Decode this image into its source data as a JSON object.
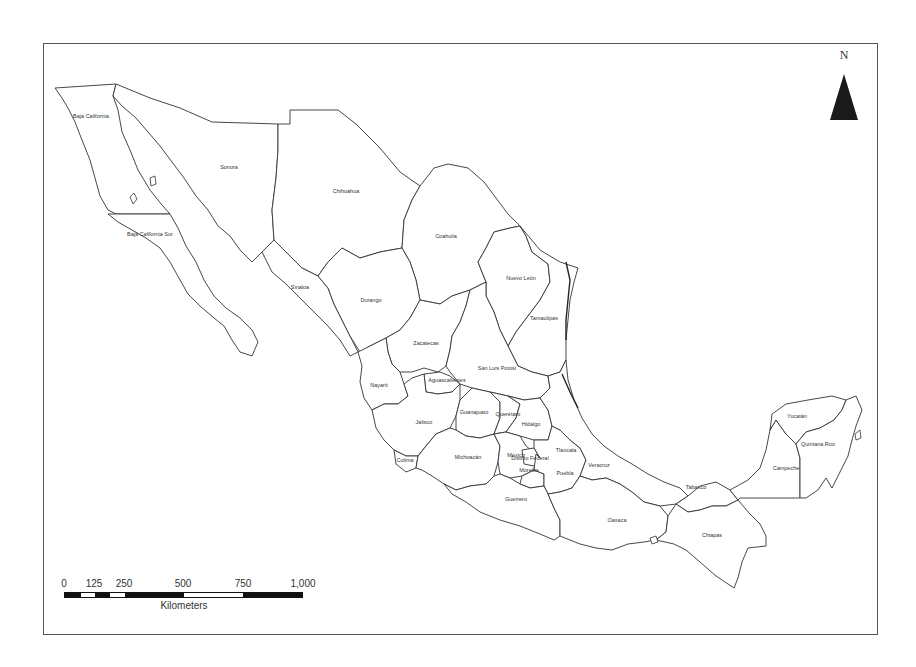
{
  "map": {
    "title": "",
    "country": "Mexico",
    "states": [
      {
        "name": "Baja California",
        "x": 91,
        "y": 118
      },
      {
        "name": "Baja California Sur",
        "x": 150,
        "y": 236
      },
      {
        "name": "Sonora",
        "x": 229,
        "y": 169
      },
      {
        "name": "Chihuahua",
        "x": 346,
        "y": 193
      },
      {
        "name": "Coahuila",
        "x": 446,
        "y": 238
      },
      {
        "name": "Nuevo León",
        "x": 521,
        "y": 280
      },
      {
        "name": "Tamaulipas",
        "x": 544,
        "y": 320
      },
      {
        "name": "Sinaloa",
        "x": 300,
        "y": 289
      },
      {
        "name": "Durango",
        "x": 371,
        "y": 302
      },
      {
        "name": "Zacatecas",
        "x": 426,
        "y": 345
      },
      {
        "name": "San Luis Potosí",
        "x": 497,
        "y": 370
      },
      {
        "name": "Nayarit",
        "x": 379,
        "y": 387
      },
      {
        "name": "Aguascalientes",
        "x": 447,
        "y": 382
      },
      {
        "name": "Guanajuato",
        "x": 474,
        "y": 414
      },
      {
        "name": "Querétaro",
        "x": 508,
        "y": 416
      },
      {
        "name": "Hidalgo",
        "x": 531,
        "y": 426
      },
      {
        "name": "Jalisco",
        "x": 424,
        "y": 424
      },
      {
        "name": "Colima",
        "x": 405,
        "y": 462
      },
      {
        "name": "Michoacán",
        "x": 468,
        "y": 459
      },
      {
        "name": "México",
        "x": 516,
        "y": 457
      },
      {
        "name": "Distrito Federal",
        "x": 530,
        "y": 460
      },
      {
        "name": "Tlaxcala",
        "x": 566,
        "y": 452
      },
      {
        "name": "Morelos",
        "x": 529,
        "y": 472
      },
      {
        "name": "Puebla",
        "x": 565,
        "y": 475
      },
      {
        "name": "Veracruz",
        "x": 599,
        "y": 467
      },
      {
        "name": "Guerrero",
        "x": 516,
        "y": 501
      },
      {
        "name": "Oaxaca",
        "x": 617,
        "y": 522
      },
      {
        "name": "Tabasco",
        "x": 696,
        "y": 489
      },
      {
        "name": "Chiapas",
        "x": 712,
        "y": 537
      },
      {
        "name": "Campeche",
        "x": 786,
        "y": 470
      },
      {
        "name": "Yucatán",
        "x": 797,
        "y": 418
      },
      {
        "name": "Quintana Roo",
        "x": 818,
        "y": 446
      }
    ]
  },
  "north_arrow": {
    "label": "N"
  },
  "scale_bar": {
    "ticks": [
      "0",
      "125",
      "250",
      "500",
      "750",
      "1,000"
    ],
    "unit": "Kilometers"
  },
  "colors": {
    "background": "#ffffff",
    "border": "#555555",
    "outline": "#333333",
    "arrow": "#1a1a1a"
  }
}
